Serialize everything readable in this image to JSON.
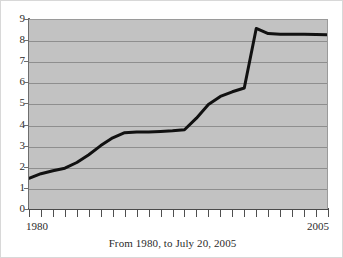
{
  "chart_data": {
    "type": "line",
    "title": "",
    "caption": "From 1980, to July 20, 2005",
    "xlabel": "",
    "ylabel": "",
    "xlim": [
      1980,
      2005
    ],
    "ylim": [
      0,
      9
    ],
    "grid": true,
    "legend": null,
    "background_color": "#c2c2c2",
    "line_color": "#111111",
    "y_ticks": [
      9,
      8,
      7,
      6,
      5,
      4,
      3,
      2,
      1,
      0
    ],
    "x_tick_labels": [
      "1980",
      "2005"
    ],
    "x_tick_count": 26,
    "x": [
      1980,
      1981,
      1982,
      1983,
      1984,
      1985,
      1986,
      1987,
      1988,
      1989,
      1990,
      1991,
      1992,
      1993,
      1994,
      1995,
      1996,
      1997,
      1998,
      1999,
      2000,
      2001,
      2002,
      2003,
      2004,
      2005
    ],
    "values": [
      1.5,
      1.72,
      1.86,
      1.98,
      2.25,
      2.62,
      3.05,
      3.42,
      3.66,
      3.7,
      3.7,
      3.72,
      3.75,
      3.8,
      4.35,
      5.0,
      5.38,
      5.6,
      5.78,
      8.6,
      8.36,
      8.33,
      8.33,
      8.32,
      8.31,
      8.3
    ],
    "series_name": ""
  }
}
